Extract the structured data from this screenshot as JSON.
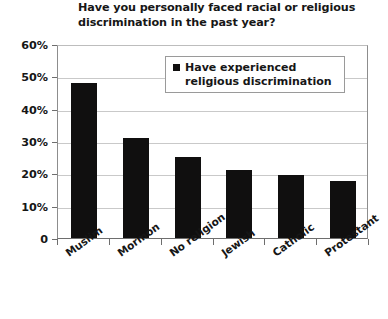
{
  "chart_data": {
    "type": "bar",
    "title": "Have you personally faced racial or religious discrimination in the past year?",
    "categories": [
      "Muslim",
      "Mormon",
      "No religion",
      "Jewish",
      "Catholic",
      "Protestant"
    ],
    "series": [
      {
        "name": "Have experienced religious discrimination",
        "values": [
          48,
          31,
          25,
          21,
          19.5,
          17.5
        ]
      }
    ],
    "xlabel": "",
    "ylabel": "",
    "ylim": [
      0,
      60
    ],
    "ytick_labels": [
      "60%",
      "50%",
      "40%",
      "30%",
      "20%",
      "10%",
      "0"
    ],
    "ytick_values": [
      60,
      50,
      40,
      30,
      20,
      10,
      0
    ],
    "grid": true,
    "legend_position": "top-right",
    "bar_color": "#100f0f"
  },
  "legend": {
    "label": "Have experienced religious discrimination"
  }
}
